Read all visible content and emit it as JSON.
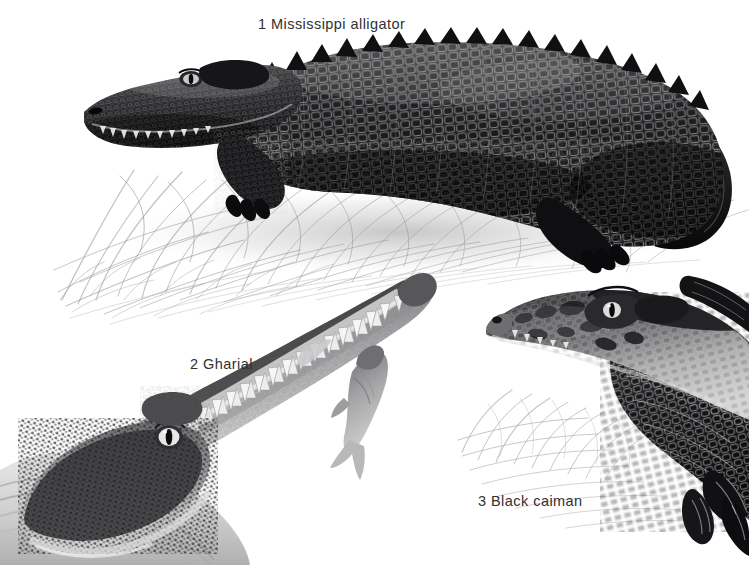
{
  "plate": {
    "title": "Crocodilians",
    "background_color": "#ffffff",
    "ink_color": "#302f32",
    "medium": "graphite and ink natural-history illustration",
    "width": 749,
    "height": 565
  },
  "captions": [
    {
      "number": "1",
      "name": "Mississippi alligator",
      "text": "1 Mississippi alligator",
      "x": 258,
      "y": 17
    },
    {
      "number": "2",
      "name": "Gharial",
      "text": "2 Gharial",
      "x": 190,
      "y": 357
    },
    {
      "number": "3",
      "name": "Black caiman",
      "text": "3  Black caiman",
      "x": 478,
      "y": 494
    }
  ],
  "figures": [
    {
      "id": "mississippi-alligator",
      "label": "1 Mississippi alligator",
      "view": "full body, lateral, facing left, lying on grass",
      "tone": "very dark, near-black armoured back with pale highlights",
      "region": {
        "x": 60,
        "y": 28,
        "width": 689,
        "height": 260
      },
      "details": [
        "osteoderm scutes",
        "dorsal spiked ridge",
        "exposed teeth",
        "clawed forelimb",
        "tail curving right"
      ]
    },
    {
      "id": "gharial",
      "label": "2 Gharial",
      "view": "head and long narrow snout, angled up to the right, holding a fish",
      "tone": "mid grey with pale belly and white interlocking teeth",
      "region": {
        "x": 0,
        "y": 265,
        "width": 450,
        "height": 300
      },
      "details": [
        "elongated needle snout",
        "interlocking teeth",
        "captured fish crosswise in jaws",
        "bulging eye",
        "knobbly cheek scales"
      ]
    },
    {
      "id": "black-caiman",
      "label": "3  Black caiman",
      "view": "head and shoulders, facing left, among grass",
      "tone": "dark mottled head with pale blotched jaw and banded scales",
      "region": {
        "x": 440,
        "y": 285,
        "width": 309,
        "height": 280
      },
      "details": [
        "blunt broad snout",
        "mottled pale jaw patches",
        "raised brow ridge over eye",
        "heavy nuchal scutes",
        "clawed foot"
      ]
    }
  ],
  "scenery": [
    {
      "id": "grass-upper",
      "description": "pencil-sketched grass tufts beneath the alligator",
      "region": {
        "x": 40,
        "y": 140,
        "width": 620,
        "height": 160
      }
    },
    {
      "id": "grass-lower",
      "description": "sparse pencil grass strokes left of the black caiman",
      "region": {
        "x": 455,
        "y": 385,
        "width": 250,
        "height": 140
      }
    }
  ],
  "icons": {
    "alligator": "alligator-icon",
    "gharial": "gharial-icon",
    "caiman": "caiman-icon",
    "fish": "fish-icon",
    "grass": "grass-icon"
  }
}
